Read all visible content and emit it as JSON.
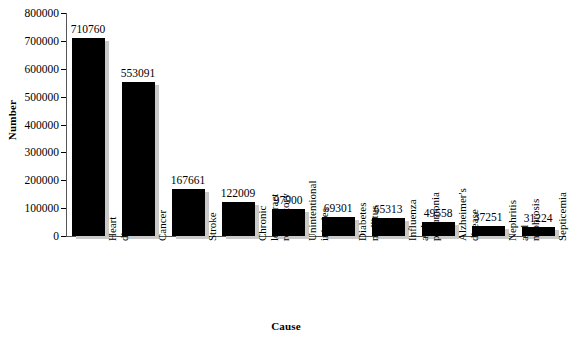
{
  "chart_data": {
    "type": "bar",
    "title": "",
    "xlabel": "Cause",
    "ylabel": "Number",
    "categories": [
      "Heart\ndisease",
      "Cancer",
      "Stroke",
      "Chronic\nlower tract\nrespiratory",
      "Unintentional\ninjuries",
      "Diabetes\nmellitus",
      "Influenza\nand\npneumonia",
      "Alzheimer's\ndisease",
      "Nephritis\nand\nnephrosis",
      "Septicemia"
    ],
    "values": [
      710760,
      553091,
      167661,
      122009,
      97900,
      69301,
      65313,
      49558,
      37251,
      31224
    ],
    "value_labels": [
      "710760",
      "553091",
      "167661",
      "122009",
      "97900",
      "69301",
      "65313",
      "49558",
      "37251",
      "31224"
    ],
    "ylim": [
      0,
      800000
    ],
    "ytick_values": [
      0,
      100000,
      200000,
      300000,
      400000,
      500000,
      600000,
      700000,
      800000
    ],
    "ytick_labels": [
      "0",
      "100000",
      "200000",
      "300000",
      "400000",
      "500000",
      "600000",
      "700000",
      "800000"
    ],
    "grid": false,
    "legend": null,
    "bar_color": "#000000",
    "bar_shadow_color": "#c9c9c9",
    "axis_color": "#555555",
    "background_color": "#ffffff"
  }
}
